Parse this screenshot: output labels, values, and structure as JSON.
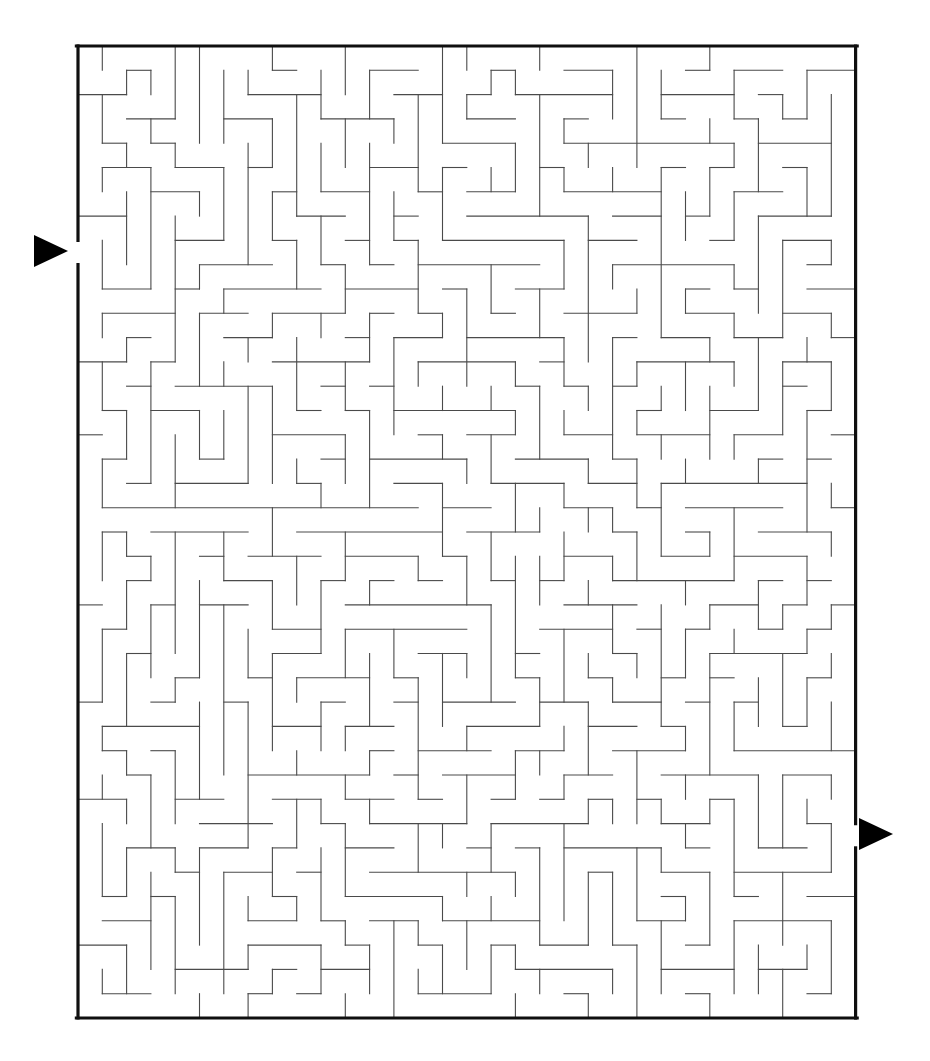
{
  "document": {
    "type": "maze-puzzle",
    "title": "Maze",
    "background_color": "#ffffff"
  },
  "canvas": {
    "width": 930,
    "height": 1061
  },
  "maze": {
    "grid_columns": 32,
    "grid_rows": 40,
    "cell_size": 24.3,
    "origin_x": 78,
    "origin_y": 46,
    "border_color": "#0f0f0f",
    "border_thickness": 3.2,
    "wall_color": "#4a4a4a",
    "wall_thickness": 1.1,
    "seed": 20250114
  },
  "entrance": {
    "label": "entrance",
    "side": "left",
    "row": 8,
    "arrow_color": "#000000",
    "arrow_direction": "right",
    "arrow_x": 34,
    "arrow_y": 251,
    "arrow_width": 34,
    "arrow_height": 32
  },
  "exit": {
    "label": "exit",
    "side": "right",
    "row": 32,
    "arrow_color": "#000000",
    "arrow_direction": "right",
    "arrow_x": 859,
    "arrow_y": 834,
    "arrow_width": 34,
    "arrow_height": 32
  }
}
